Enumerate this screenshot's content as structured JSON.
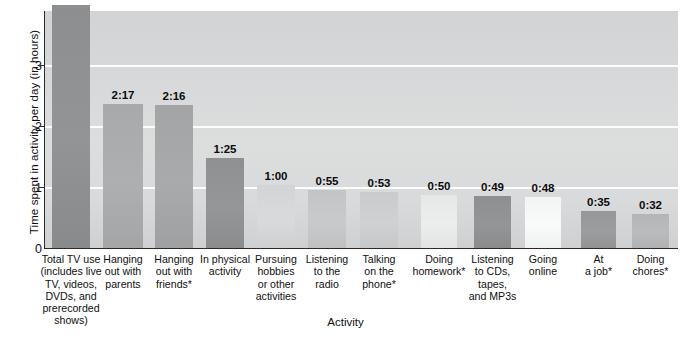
{
  "chart_data": {
    "type": "bar",
    "title": "",
    "subtitle": "",
    "xlabel": "Activity",
    "ylabel": "Time spent in activity per day (in hours)",
    "ylim": [
      0,
      3.75
    ],
    "yticks": [
      0,
      1,
      2,
      3
    ],
    "ytick_labels": [
      "0",
      "1",
      "2",
      "3"
    ],
    "grid": "horizontal-white-gridlines",
    "legend": "none",
    "categories": [
      "Total TV use (includes live TV, videos, DVDs, and prerecorded shows)",
      "Hanging out with parents",
      "Hanging out with friends*",
      "In physical activity",
      "Pursuing hobbies or other activities",
      "Listening to the radio",
      "Talking on the phone*",
      "Doing homework*",
      "Listening to CDs, tapes, and MP3s",
      "Going online",
      "At a job*",
      "Doing chores*"
    ],
    "value_labels": [
      "3:51",
      "2:17",
      "2:16",
      "1:25",
      "1:00",
      "0:55",
      "0:53",
      "0:50",
      "0:49",
      "0:48",
      "0:35",
      "0:32"
    ],
    "values": [
      3.85,
      2.283,
      2.267,
      1.417,
      1.0,
      0.917,
      0.883,
      0.833,
      0.817,
      0.8,
      0.583,
      0.533
    ],
    "bar_colors": [
      "#8d8e90",
      "#a8a9ab",
      "#a3a4a6",
      "#8f9092",
      "#d3d4d5",
      "#c3c4c5",
      "#cacbcc",
      "#e6e7e7",
      "#8e8f91",
      "#f3f4f4",
      "#969799",
      "#b4b5b7"
    ]
  },
  "axes": {
    "y_title": "Time spent in activity per day (in hours)",
    "x_title": "Activity",
    "y_tick_0": "0",
    "y_tick_1": "1",
    "y_tick_2": "2",
    "y_tick_3": "3"
  },
  "categories_display": [
    {
      "lines": [
        "Total TV use",
        "(includes live",
        "TV, videos,",
        "DVDs, and",
        "prerecorded",
        "shows)"
      ]
    },
    {
      "lines": [
        "Hanging",
        "out with",
        "parents"
      ]
    },
    {
      "lines": [
        "Hanging",
        "out with",
        "friends*"
      ]
    },
    {
      "lines": [
        "In physical",
        "activity"
      ]
    },
    {
      "lines": [
        "Pursuing",
        "hobbies",
        "or other",
        "activities"
      ]
    },
    {
      "lines": [
        "Listening",
        "to the",
        "radio"
      ]
    },
    {
      "lines": [
        "Talking",
        "on the",
        "phone*"
      ]
    },
    {
      "lines": [
        "Doing",
        "homework*"
      ]
    },
    {
      "lines": [
        "Listening",
        "to CDs,",
        "tapes,",
        "and MP3s"
      ]
    },
    {
      "lines": [
        "Going",
        "online"
      ]
    },
    {
      "lines": [
        "At",
        "a job*"
      ]
    },
    {
      "lines": [
        "Doing",
        "chores*"
      ]
    }
  ]
}
